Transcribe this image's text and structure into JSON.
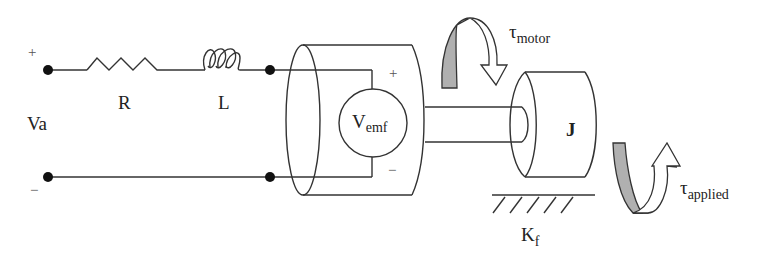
{
  "diagram": {
    "circuit": {
      "source_label": "Va",
      "plus_sign": "+",
      "minus_sign": "−",
      "resistor_label": "R",
      "inductor_label": "L",
      "emf_label_main": "V",
      "emf_label_sub": "emf",
      "emf_plus": "+",
      "emf_minus": "−"
    },
    "mechanical": {
      "inertia_label": "J",
      "friction_label_main": "K",
      "friction_label_sub": "f",
      "motor_torque_main": "τ",
      "motor_torque_sub": "motor",
      "applied_torque_main": "τ",
      "applied_torque_sub": "applied"
    },
    "colors": {
      "line": "#333333",
      "arrow_fill": "#b0b0b0",
      "bg": "#ffffff"
    }
  }
}
